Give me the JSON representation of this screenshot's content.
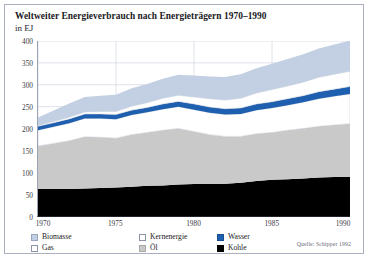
{
  "figure": {
    "title": "Weltweiter Energieverbrauch nach Energieträgern 1970–1990",
    "subtitle": "in EJ",
    "source": "Quelle: Schipper 1992",
    "caption_partial": ""
  },
  "legend": {
    "items": [
      {
        "label": "Biomasse",
        "color": "#c3cfe2",
        "border": "#9aa6bd",
        "col": 0,
        "row": 0
      },
      {
        "label": "Gas",
        "color": "#ffffff",
        "border": "#8c94a6",
        "col": 0,
        "row": 1
      },
      {
        "label": "Kernenergie",
        "color": "#ffffff",
        "border": "#8c94a6",
        "col": 1,
        "row": 0
      },
      {
        "label": "Öl",
        "color": "#c9c9c9",
        "border": "#a8a8a8",
        "col": 1,
        "row": 1
      },
      {
        "label": "Wasser",
        "color": "#1f5faf",
        "border": "#1a4f93",
        "col": 2,
        "row": 0
      },
      {
        "label": "Kohle",
        "color": "#000000",
        "border": "#000000",
        "col": 2,
        "row": 1
      }
    ]
  },
  "chart_data": {
    "type": "area",
    "title": "Weltweiter Energieverbrauch nach Energieträgern 1970–1990",
    "subtitle": "in EJ",
    "xlabel": "",
    "ylabel": "EJ",
    "xlim": [
      1970,
      1990
    ],
    "ylim": [
      0,
      400
    ],
    "yticks": [
      0,
      50,
      100,
      150,
      200,
      250,
      300,
      350,
      400
    ],
    "xticks": [
      1970,
      1975,
      1980,
      1985,
      1990
    ],
    "grid": "horizontal",
    "legend_position": "below",
    "stacked": true,
    "stack_order": [
      "Kohle",
      "Öl",
      "Gas",
      "Wasser",
      "Kernenergie",
      "Biomasse"
    ],
    "x": [
      1970,
      1971,
      1972,
      1973,
      1974,
      1975,
      1976,
      1977,
      1978,
      1979,
      1980,
      1981,
      1982,
      1983,
      1984,
      1985,
      1986,
      1987,
      1988,
      1989,
      1990
    ],
    "series": [
      {
        "name": "Kohle",
        "color": "#000000",
        "values": [
          62,
          62,
          62,
          63,
          64,
          65,
          67,
          69,
          70,
          72,
          73,
          73,
          74,
          76,
          80,
          83,
          84,
          86,
          88,
          89,
          90
        ]
      },
      {
        "name": "Öl",
        "color": "#c9c9c9",
        "values": [
          98,
          104,
          110,
          118,
          116,
          113,
          119,
          122,
          126,
          128,
          120,
          113,
          108,
          106,
          108,
          108,
          112,
          114,
          117,
          119,
          121
        ]
      },
      {
        "name": "Gas",
        "color": "#ffffff",
        "values": [
          36,
          38,
          40,
          42,
          43,
          43,
          45,
          46,
          48,
          50,
          50,
          50,
          50,
          51,
          54,
          56,
          57,
          60,
          63,
          66,
          68
        ]
      },
      {
        "name": "Wasser",
        "color": "#1f5faf",
        "values": [
          9,
          9,
          10,
          10,
          10,
          11,
          11,
          11,
          12,
          12,
          13,
          13,
          13,
          14,
          14,
          14,
          15,
          15,
          16,
          16,
          17
        ]
      },
      {
        "name": "Kernenergie",
        "color": "#ffffff",
        "values": [
          2,
          3,
          4,
          5,
          6,
          7,
          9,
          11,
          13,
          14,
          16,
          19,
          20,
          22,
          25,
          28,
          29,
          31,
          33,
          34,
          35
        ]
      },
      {
        "name": "Biomasse",
        "color": "#c3cfe2",
        "values": [
          18,
          25,
          31,
          34,
          36,
          38,
          41,
          43,
          45,
          47,
          49,
          51,
          53,
          55,
          57,
          59,
          62,
          64,
          66,
          68,
          70
        ]
      }
    ],
    "totals": [
      225,
      241,
      257,
      272,
      275,
      277,
      292,
      302,
      314,
      323,
      321,
      319,
      318,
      324,
      338,
      348,
      359,
      370,
      383,
      392,
      401
    ],
    "annotations": []
  },
  "axes": {
    "ytick_labels": [
      "0",
      "50",
      "100",
      "150",
      "200",
      "250",
      "300",
      "350",
      "400"
    ],
    "xtick_labels": [
      "1970",
      "1975",
      "1980",
      "1985",
      "1990"
    ]
  }
}
